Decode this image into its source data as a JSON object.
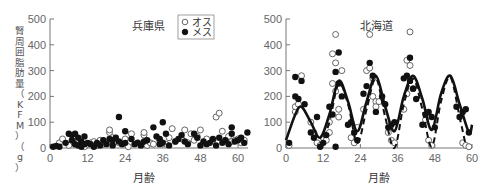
{
  "chart_data": [
    {
      "type": "scatter",
      "title": "兵庫県",
      "xlabel": "月齢",
      "ylabel": "腎周囲脂肪量（KFM）（g）",
      "xlim": [
        0,
        64
      ],
      "ylim": [
        0,
        500
      ],
      "xticks": [
        0,
        12,
        24,
        36,
        48,
        60
      ],
      "yticks": [
        0,
        100,
        200,
        300,
        400,
        500
      ],
      "grid": false,
      "legend": {
        "position": "top-right",
        "entries": [
          {
            "label": "オス",
            "marker": "open-circle"
          },
          {
            "label": "メス",
            "marker": "filled-circle"
          }
        ]
      },
      "series": [
        {
          "name": "オス",
          "marker": "open-circle",
          "x": [
            3,
            4,
            6,
            8,
            9,
            10,
            11,
            12,
            13,
            14,
            15,
            16,
            17,
            18,
            19,
            19,
            20,
            21,
            22,
            23,
            24,
            25,
            26,
            28,
            29,
            30,
            30,
            31,
            32,
            33,
            35,
            36,
            37,
            38,
            39,
            40,
            42,
            43,
            44,
            45,
            46,
            47,
            48,
            49,
            50,
            52,
            53,
            54,
            55,
            56,
            57,
            58,
            59,
            60,
            61,
            62
          ],
          "y": [
            20,
            35,
            10,
            15,
            25,
            20,
            5,
            15,
            20,
            25,
            10,
            30,
            15,
            20,
            60,
            70,
            40,
            25,
            20,
            15,
            35,
            5,
            55,
            20,
            15,
            50,
            60,
            10,
            20,
            15,
            30,
            20,
            15,
            40,
            75,
            25,
            35,
            70,
            20,
            55,
            30,
            45,
            70,
            20,
            35,
            30,
            120,
            135,
            65,
            30,
            45,
            25,
            30,
            35,
            20,
            30
          ]
        },
        {
          "name": "メス",
          "marker": "filled-circle",
          "x": [
            1,
            2,
            3,
            5,
            6,
            7,
            7,
            8,
            8,
            9,
            9,
            10,
            10,
            11,
            11,
            12,
            13,
            14,
            15,
            16,
            17,
            18,
            19,
            20,
            20,
            21,
            22,
            22,
            23,
            24,
            24,
            26,
            27,
            28,
            29,
            30,
            31,
            33,
            34,
            35,
            35,
            36,
            36,
            37,
            38,
            40,
            41,
            42,
            43,
            44,
            46,
            47,
            48,
            49,
            50,
            51,
            52,
            53,
            54,
            55,
            56,
            57,
            58,
            58,
            59,
            60,
            61,
            62,
            63
          ],
          "y": [
            5,
            8,
            5,
            20,
            55,
            50,
            30,
            55,
            15,
            40,
            10,
            25,
            5,
            45,
            15,
            20,
            15,
            5,
            20,
            10,
            30,
            15,
            35,
            30,
            10,
            40,
            120,
            25,
            15,
            65,
            20,
            35,
            15,
            20,
            10,
            25,
            30,
            80,
            45,
            15,
            35,
            100,
            20,
            55,
            10,
            25,
            35,
            50,
            25,
            15,
            55,
            40,
            10,
            25,
            15,
            20,
            35,
            10,
            40,
            20,
            30,
            15,
            55,
            80,
            25,
            30,
            40,
            20,
            60
          ]
        }
      ]
    },
    {
      "type": "scatter",
      "title": "北海道",
      "xlabel": "月齢",
      "ylabel": "",
      "xlim": [
        0,
        60
      ],
      "ylim": [
        0,
        500
      ],
      "xticks": [
        0,
        12,
        24,
        36,
        48,
        60
      ],
      "yticks": [
        0,
        100,
        200,
        300,
        400,
        500
      ],
      "grid": false,
      "series": [
        {
          "name": "オス",
          "marker": "open-circle",
          "x": [
            1,
            3,
            3,
            4,
            5,
            8,
            9,
            10,
            11,
            12,
            13,
            14,
            14,
            15,
            15,
            16,
            16,
            16,
            17,
            17,
            18,
            21,
            22,
            23,
            25,
            26,
            27,
            27,
            28,
            28,
            29,
            29,
            30,
            33,
            34,
            35,
            38,
            39,
            39,
            40,
            40,
            41,
            45,
            46,
            47,
            57,
            58,
            59
          ],
          "y": [
            10,
            140,
            160,
            170,
            280,
            100,
            60,
            20,
            10,
            40,
            30,
            60,
            100,
            250,
            365,
            440,
            330,
            220,
            150,
            120,
            300,
            40,
            20,
            80,
            150,
            300,
            310,
            440,
            270,
            200,
            180,
            160,
            180,
            60,
            30,
            20,
            150,
            340,
            210,
            450,
            320,
            230,
            110,
            30,
            10,
            20,
            10,
            5
          ]
        },
        {
          "name": "メス",
          "marker": "filled-circle",
          "x": [
            1,
            3,
            3,
            4,
            5,
            6,
            8,
            9,
            10,
            11,
            12,
            13,
            14,
            15,
            16,
            16,
            17,
            17,
            18,
            20,
            21,
            22,
            23,
            25,
            26,
            27,
            28,
            29,
            31,
            32,
            33,
            34,
            35,
            38,
            39,
            40,
            40,
            41,
            42,
            44,
            45,
            46,
            47,
            48,
            55,
            56,
            57,
            58,
            59
          ],
          "y": [
            20,
            275,
            200,
            190,
            260,
            170,
            60,
            40,
            120,
            5,
            20,
            50,
            160,
            130,
            5,
            295,
            370,
            250,
            200,
            90,
            100,
            60,
            30,
            210,
            240,
            330,
            280,
            140,
            200,
            170,
            80,
            90,
            100,
            270,
            280,
            350,
            260,
            230,
            190,
            90,
            130,
            140,
            120,
            80,
            160,
            120,
            140,
            150,
            60
          ]
        },
        {
          "name": "fit-solid",
          "type": "line",
          "style": "solid",
          "x": [
            0,
            3,
            5,
            8,
            11,
            14,
            17,
            20,
            23,
            26,
            29,
            32,
            35,
            38,
            41,
            44,
            47,
            50,
            53,
            56,
            59,
            60
          ],
          "y": [
            30,
            130,
            160,
            100,
            40,
            130,
            260,
            180,
            65,
            180,
            280,
            160,
            65,
            200,
            280,
            190,
            70,
            210,
            280,
            170,
            60,
            90
          ]
        },
        {
          "name": "fit-dashed",
          "type": "line",
          "style": "dashed",
          "x": [
            11,
            14,
            17,
            20,
            23,
            26,
            29,
            32,
            35,
            38,
            41,
            44,
            47,
            50,
            53,
            56,
            58
          ],
          "y": [
            5,
            100,
            250,
            170,
            20,
            150,
            270,
            120,
            0,
            170,
            270,
            150,
            5,
            180,
            275,
            120,
            10
          ]
        }
      ]
    }
  ]
}
